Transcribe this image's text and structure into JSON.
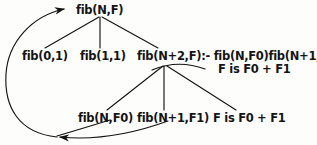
{
  "diagram": {
    "ink_color": "#141414",
    "background_color": "#fdfdfc",
    "nodes": {
      "root": "fib(N,F)",
      "fact_base0": "fib(0,1)",
      "fact_base1": "fib(1,1)",
      "clause_line1": "fib(N+2,F):- fib(N,F0)fib(N+1,F1),",
      "clause_line2": "F is F0 + F1",
      "goal_fib_n_f0": "fib(N,F0)",
      "goal_fib_n1_f1": "fib(N+1,F1)",
      "goal_is_expr": "F is  F0 + F1"
    }
  }
}
